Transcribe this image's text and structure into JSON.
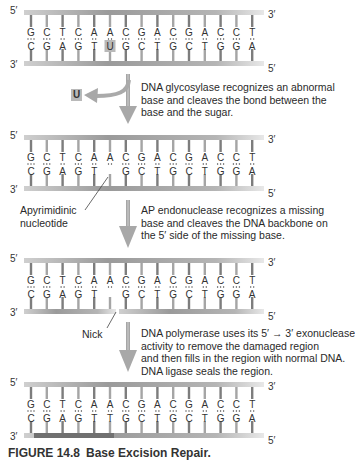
{
  "sequence": {
    "top_strand": [
      "G",
      "C",
      "T",
      "C",
      "A",
      "A",
      "C",
      "G",
      "A",
      "C",
      "G",
      "A",
      "C",
      "C",
      "T"
    ],
    "bottom_strand": [
      "C",
      "G",
      "A",
      "G",
      "T",
      "U",
      "G",
      "C",
      "T",
      "G",
      "C",
      "T",
      "G",
      "G",
      "A"
    ]
  },
  "panels": [
    {
      "id": "1",
      "top_left": "5′",
      "top_right": "3′",
      "bottom_left": "3′",
      "bottom_right": "5′",
      "bottom_bases": [
        "C",
        "G",
        "A",
        "G",
        "T",
        "U",
        "G",
        "C",
        "T",
        "G",
        "C",
        "T",
        "G",
        "G",
        "A"
      ],
      "highlight_index": 5
    },
    {
      "id": "2",
      "top_left": "5′",
      "top_right": "3′",
      "bottom_left": "3′",
      "bottom_right": "5′",
      "bottom_bases": [
        "C",
        "G",
        "A",
        "G",
        "T",
        "",
        "G",
        "C",
        "T",
        "G",
        "C",
        "T",
        "G",
        "G",
        "A"
      ],
      "label": "Apyrimidinic nucleotide"
    },
    {
      "id": "3",
      "top_left": "5′",
      "top_right": "3′",
      "bottom_left": "3′",
      "bottom_right": "5′",
      "bottom_bases": [
        "C",
        "G",
        "A",
        "G",
        "T",
        "",
        "G",
        "C",
        "T",
        "G",
        "C",
        "T",
        "G",
        "G",
        "A"
      ],
      "label": "Nick"
    },
    {
      "id": "4",
      "top_left": "5′",
      "top_right": "3′",
      "bottom_left": "3′",
      "bottom_right": "5′",
      "bottom_bases": [
        "C",
        "G",
        "A",
        "G",
        "T",
        "T",
        "G",
        "C",
        "T",
        "G",
        "C",
        "T",
        "G",
        "G",
        "A"
      ]
    }
  ],
  "steps": [
    {
      "line1": "DNA glycosylase recognizes an abnormal",
      "line2": "base and cleaves the bond between the",
      "line3": "base and the sugar."
    },
    {
      "line1": "AP endonuclease recognizes a missing",
      "line2": "base and cleaves the DNA backbone on",
      "line3": "the 5′ side of the missing base."
    },
    {
      "line1": "DNA polymerase uses its 5′ → 3′ exonuclease",
      "line2": "activity to remove the damaged region",
      "line3": "and then fills in the region with normal DNA.",
      "line4": "DNA ligase seals the region."
    }
  ],
  "labels": {
    "removed_base": "U",
    "apyrimidinic_1": "Apyrimidinic",
    "apyrimidinic_2": "nucleotide",
    "nick": "Nick"
  },
  "caption": {
    "figure": "FIGURE 14.8",
    "title": "Base Excision Repair."
  },
  "colors": {
    "backbone_light": "#d8d8d8",
    "backbone_dark": "#8a8a8a",
    "arrow": "#a8a8a8",
    "new_dna": "#707070",
    "uracil_box": "#b9b9b9"
  }
}
